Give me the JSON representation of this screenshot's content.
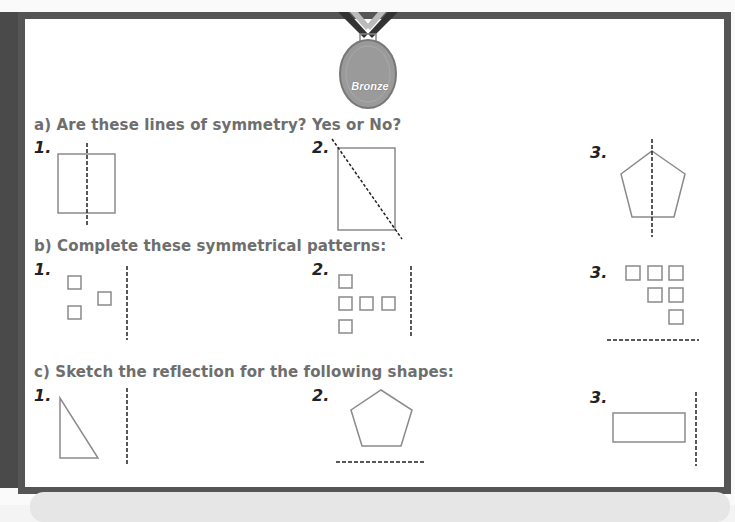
{
  "medal": {
    "label": "Bronze",
    "color": "#9a9a9a"
  },
  "sections": [
    {
      "heading": "a) Are these lines of symmetry? Yes or No?",
      "items": [
        {
          "number": "1.",
          "shape": "square",
          "line": "vertical-dashed"
        },
        {
          "number": "2.",
          "shape": "rectangle",
          "line": "diagonal-dashed"
        },
        {
          "number": "3.",
          "shape": "pentagon",
          "line": "vertical-dashed"
        }
      ]
    },
    {
      "heading": "b) Complete these symmetrical patterns:",
      "items": [
        {
          "number": "1.",
          "shape": "three-squares",
          "line": "vertical-dashed"
        },
        {
          "number": "2.",
          "shape": "t-pattern-squares",
          "line": "vertical-dashed"
        },
        {
          "number": "3.",
          "shape": "staircase-squares",
          "line": "horizontal-dashed"
        }
      ]
    },
    {
      "heading": "c) Sketch the reflection for the following shapes:",
      "items": [
        {
          "number": "1.",
          "shape": "right-triangle",
          "line": "vertical-dashed"
        },
        {
          "number": "2.",
          "shape": "pentagon",
          "line": "horizontal-dashed"
        },
        {
          "number": "3.",
          "shape": "rectangle",
          "line": "vertical-dashed"
        }
      ]
    }
  ],
  "colors": {
    "frame": "#555555",
    "heading": "#6e6e6e",
    "shape_stroke": "#8a8a8a",
    "dashed_line": "#222222"
  }
}
